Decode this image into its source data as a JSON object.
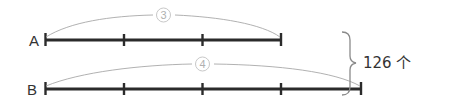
{
  "diagram": {
    "type": "segment-diagram",
    "colors": {
      "segment": "#2b2b2b",
      "arc": "#a8a8a8",
      "circle": "#c8c8c8",
      "text": "#333333"
    },
    "rows": [
      {
        "label": "A",
        "units": 3,
        "circled_number": "3"
      },
      {
        "label": "B",
        "units": 4,
        "circled_number": "4"
      }
    ],
    "brace_total": "126 个"
  }
}
